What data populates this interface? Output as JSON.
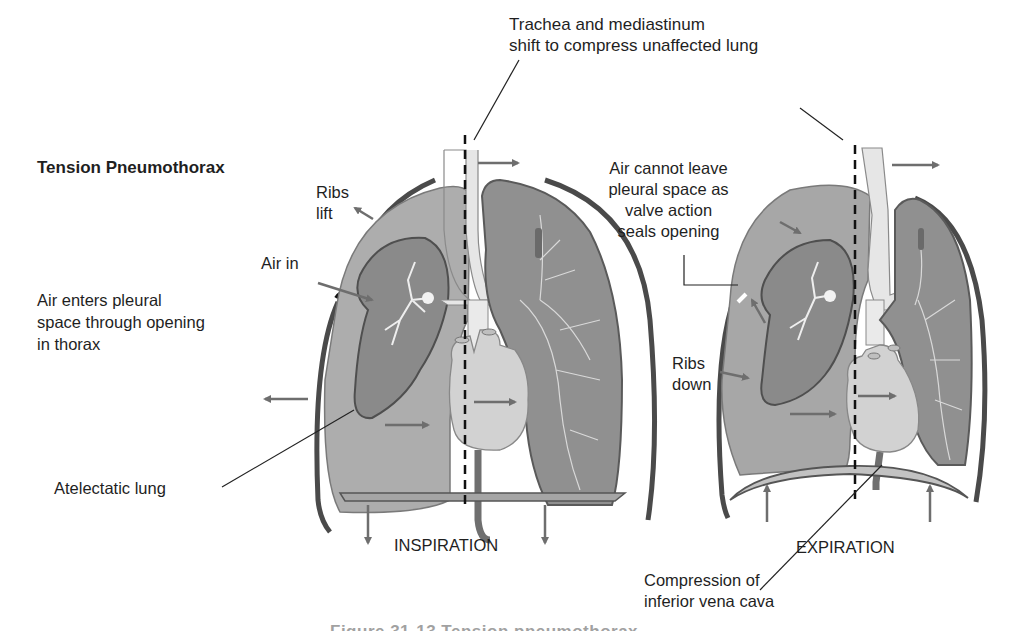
{
  "figure": {
    "title": "Tension Pneumothorax",
    "caption_partial": "Figure 31-13 Tension pneumothorax",
    "colors": {
      "lung_fill": "#a9a9a9",
      "collapsed_lung": "#8b8b8b",
      "airway": "#e8e8e8",
      "heart": "#d2d2d2",
      "chest_wall": "#555555",
      "arrow": "#6e6e6e",
      "text": "#1f1f1f"
    }
  },
  "labels": {
    "mediastinal_shift": [
      "Trachea and mediastinum",
      "shift to compress unaffected lung"
    ],
    "ribs_lift": [
      "Ribs",
      "lift"
    ],
    "air_in": "Air in",
    "air_enters": [
      "Air enters pleural",
      "space through opening",
      "in thorax"
    ],
    "atelectatic_lung": "Atelectatic lung",
    "inspiration": "INSPIRATION",
    "air_cannot_leave": [
      "Air cannot leave",
      "pleural space as",
      "valve action",
      "seals opening"
    ],
    "ribs_down": [
      "Ribs",
      "down"
    ],
    "expiration": "EXPIRATION",
    "ivc_compression": [
      "Compression of",
      "inferior vena cava"
    ]
  },
  "panels": [
    {
      "name": "inspiration",
      "phase_label": "INSPIRATION"
    },
    {
      "name": "expiration",
      "phase_label": "EXPIRATION"
    }
  ]
}
